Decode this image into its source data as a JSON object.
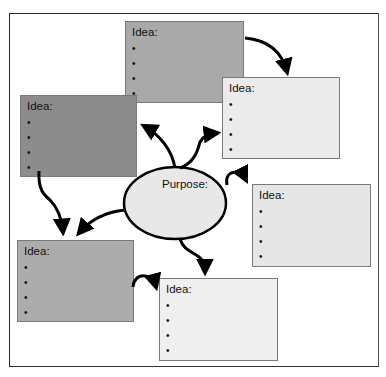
{
  "diagram": {
    "type": "idea web / mind map",
    "center": {
      "label": "Purpose:",
      "fill": "#e8e8e8"
    },
    "boxes": [
      {
        "id": "top",
        "label": "Idea:",
        "bullets": [
          "",
          "",
          "",
          ""
        ],
        "fill": "#a9a9a9",
        "x": 125,
        "y": 21,
        "w": 119,
        "h": 82
      },
      {
        "id": "upper-right",
        "label": "Idea:",
        "bullets": [
          "",
          "",
          "",
          ""
        ],
        "fill": "#ebebeb",
        "x": 222,
        "y": 77,
        "w": 118,
        "h": 82
      },
      {
        "id": "left-dark",
        "label": "Idea:",
        "bullets": [
          "",
          "",
          "",
          ""
        ],
        "fill": "#8c8c8c",
        "x": 20,
        "y": 95,
        "w": 117,
        "h": 82
      },
      {
        "id": "right-middle",
        "label": "Idea:",
        "bullets": [
          "",
          "",
          "",
          ""
        ],
        "fill": "#e6e6e6",
        "x": 252,
        "y": 184,
        "w": 119,
        "h": 83
      },
      {
        "id": "bottom-left",
        "label": "Idea:",
        "bullets": [
          "",
          "",
          "",
          ""
        ],
        "fill": "#acacac",
        "x": 17,
        "y": 240,
        "w": 117,
        "h": 82
      },
      {
        "id": "bottom-center",
        "label": "Idea:",
        "bullets": [
          "",
          "",
          "",
          ""
        ],
        "fill": "#efefef",
        "x": 159,
        "y": 278,
        "w": 119,
        "h": 83
      }
    ],
    "connections": [
      {
        "from": "top",
        "to": "upper-right"
      },
      {
        "from": "center",
        "to": "left-dark"
      },
      {
        "from": "center",
        "to": "upper-right"
      },
      {
        "from": "center",
        "to": "right-middle"
      },
      {
        "from": "center",
        "to": "bottom-left"
      },
      {
        "from": "center",
        "to": "bottom-center"
      },
      {
        "from": "left-dark",
        "to": "bottom-left"
      },
      {
        "from": "bottom-left",
        "to": "bottom-center"
      }
    ]
  }
}
